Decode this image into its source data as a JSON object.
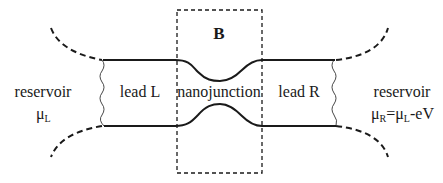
{
  "diagram": {
    "box_label": "B",
    "regions": {
      "reservoir_left": {
        "label": "reservoir",
        "potential_symbol": "μ",
        "potential_sub": "L"
      },
      "lead_left": {
        "label": "lead L"
      },
      "junction": {
        "label": "nanojunction"
      },
      "lead_right": {
        "label": "lead R"
      },
      "reservoir_right": {
        "label": "reservoir",
        "potential_symbol": "μ",
        "potential_sub": "R",
        "equals": "=",
        "rhs_symbol": "μ",
        "rhs_sub": "L",
        "rhs_tail": "-eV"
      }
    },
    "colors": {
      "stroke": "#1a1a1a",
      "background": "#ffffff"
    }
  }
}
